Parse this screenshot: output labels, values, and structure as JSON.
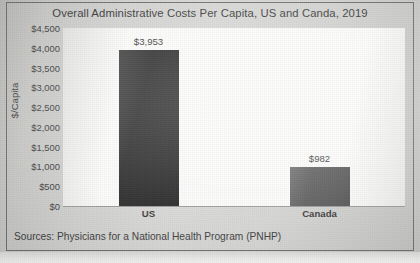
{
  "chart_data": {
    "type": "bar",
    "title": "Overall Administrative Costs Per Capita, US and Canda, 2019",
    "xlabel": "",
    "ylabel": "$/Capita",
    "categories": [
      "US",
      "Canada"
    ],
    "values": [
      3953,
      982
    ],
    "value_labels": [
      "$3,953",
      "$982"
    ],
    "ylim": [
      0,
      4500
    ],
    "ytick_values": [
      0,
      500,
      1000,
      1500,
      2000,
      2500,
      3000,
      3500,
      4000,
      4500
    ],
    "ytick_labels": [
      "$0",
      "$500",
      "$1,000",
      "$1,500",
      "$2,000",
      "$2,500",
      "$3,000",
      "$3,500",
      "$4,000",
      "$4,500"
    ],
    "grid": false,
    "legend": false,
    "bar_colors": [
      "#262626",
      "#575757"
    ],
    "series": [
      {
        "name": "Administrative cost per capita",
        "values": [
          3953,
          982
        ]
      }
    ]
  },
  "source_note": "Sources: Physicians for a National Health Program (PNHP)",
  "colors": {
    "us_bar": "#262626",
    "canada_bar": "#575757",
    "axis_line": "#9a9a98",
    "frame_border": "#6f6f6d",
    "plot_background": "#fbfbfa",
    "text": "#3b3b3b"
  }
}
